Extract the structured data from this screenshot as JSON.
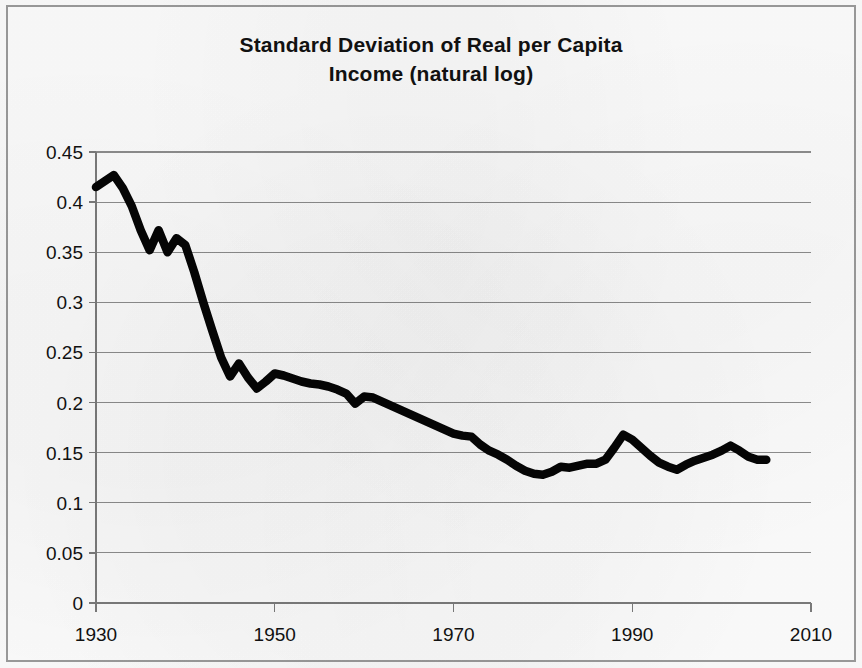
{
  "figure": {
    "title_line1": "Standard Deviation of Real per Capita",
    "title_line2": "Income (natural log)",
    "background_color": "#fcfcfc",
    "border_color": "#9a9a9a",
    "line_color": "#050505",
    "gridline_color": "#8d8d8d"
  },
  "chart_data": {
    "type": "line",
    "title": "Standard Deviation of Real per Capita Income (natural log)",
    "xlabel": "",
    "ylabel": "",
    "xlim": [
      1930,
      2010
    ],
    "ylim": [
      0,
      0.45
    ],
    "grid": "horizontal",
    "legend": "none",
    "x_tick_labels": [
      "1930",
      "1950",
      "1970",
      "1990",
      "2010"
    ],
    "x_ticks": [
      1930,
      1950,
      1970,
      1990,
      2010
    ],
    "y_tick_labels": [
      "0",
      "0.05",
      "0.1",
      "0.15",
      "0.2",
      "0.25",
      "0.3",
      "0.35",
      "0.4",
      "0.45"
    ],
    "y_ticks": [
      0,
      0.05,
      0.1,
      0.15,
      0.2,
      0.25,
      0.3,
      0.35,
      0.4,
      0.45
    ],
    "series": [
      {
        "name": "Standard deviation of log real per capita income",
        "x": [
          1930,
          1931,
          1932,
          1933,
          1934,
          1935,
          1936,
          1937,
          1938,
          1939,
          1940,
          1941,
          1942,
          1943,
          1944,
          1945,
          1946,
          1947,
          1948,
          1949,
          1950,
          1951,
          1952,
          1953,
          1954,
          1955,
          1956,
          1957,
          1958,
          1959,
          1960,
          1961,
          1962,
          1963,
          1964,
          1965,
          1966,
          1967,
          1968,
          1969,
          1970,
          1971,
          1972,
          1973,
          1974,
          1975,
          1976,
          1977,
          1978,
          1979,
          1980,
          1981,
          1982,
          1983,
          1984,
          1985,
          1986,
          1987,
          1988,
          1989,
          1990,
          1991,
          1992,
          1993,
          1994,
          1995,
          1996,
          1997,
          1998,
          1999,
          2000,
          2001,
          2002,
          2003,
          2004,
          2005
        ],
        "values": [
          0.415,
          0.421,
          0.427,
          0.414,
          0.396,
          0.372,
          0.352,
          0.372,
          0.35,
          0.364,
          0.357,
          0.33,
          0.3,
          0.272,
          0.245,
          0.226,
          0.239,
          0.225,
          0.214,
          0.221,
          0.229,
          0.227,
          0.224,
          0.221,
          0.219,
          0.218,
          0.216,
          0.213,
          0.209,
          0.199,
          0.206,
          0.205,
          0.201,
          0.197,
          0.193,
          0.189,
          0.185,
          0.181,
          0.177,
          0.173,
          0.169,
          0.167,
          0.166,
          0.158,
          0.152,
          0.148,
          0.143,
          0.137,
          0.132,
          0.129,
          0.128,
          0.131,
          0.136,
          0.135,
          0.137,
          0.139,
          0.139,
          0.143,
          0.155,
          0.168,
          0.163,
          0.155,
          0.147,
          0.14,
          0.136,
          0.133,
          0.138,
          0.142,
          0.145,
          0.148,
          0.152,
          0.157,
          0.152,
          0.146,
          0.143,
          0.143
        ]
      }
    ]
  },
  "axes_geometry": {
    "left_px": 96,
    "right_px": 811,
    "top_px": 152,
    "bottom_px": 603
  }
}
